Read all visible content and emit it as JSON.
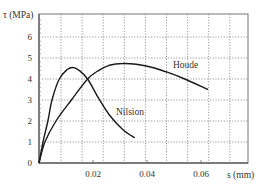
{
  "chart_data": {
    "type": "line",
    "title": "",
    "xlabel": "s (mm)",
    "ylabel": "τ (MPa)",
    "xlim": [
      0,
      0.0775
    ],
    "ylim": [
      0,
      7.1
    ],
    "xticks": [
      0.02,
      0.04,
      0.06
    ],
    "xtick_labels": [
      "0.02",
      "0.04",
      "0.06"
    ],
    "yticks": [
      0,
      1,
      2,
      3,
      4,
      5,
      6
    ],
    "ytick_labels": [
      "0",
      "1",
      "2",
      "3",
      "4",
      "5",
      "6"
    ],
    "grid": true,
    "legend": "inline labels",
    "series": [
      {
        "name": "Houde",
        "x": [
          0,
          0.0022,
          0.0063,
          0.012,
          0.018,
          0.022,
          0.026,
          0.031,
          0.036,
          0.042,
          0.048,
          0.054,
          0.0626
        ],
        "y": [
          0,
          1.0,
          2.0,
          3.0,
          4.0,
          4.4,
          4.65,
          4.74,
          4.7,
          4.55,
          4.3,
          4.0,
          3.5
        ]
      },
      {
        "name": "Nilsion",
        "x": [
          0,
          0.0015,
          0.0033,
          0.0048,
          0.0075,
          0.0105,
          0.0126,
          0.015,
          0.018,
          0.022,
          0.026,
          0.031,
          0.0355
        ],
        "y": [
          0,
          1.0,
          2.0,
          3.0,
          4.0,
          4.45,
          4.55,
          4.4,
          4.0,
          3.1,
          2.3,
          1.6,
          1.2
        ]
      }
    ],
    "annotations": [
      {
        "text": "Houde",
        "x": 0.0497,
        "y": 4.6
      },
      {
        "text": "Nilsion",
        "x": 0.0285,
        "y": 2.4
      }
    ]
  },
  "labels": {
    "ylabel": "τ (MPa)",
    "xlabel": "s (mm)",
    "houde": "Houde",
    "nilsion": "Nilsion"
  }
}
